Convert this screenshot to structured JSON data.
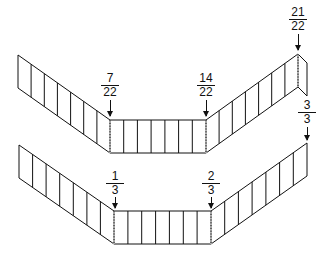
{
  "diagram": {
    "title": "",
    "strips": [
      {
        "id": "top-strip",
        "segments_total": 22,
        "labels": [
          {
            "num": "7",
            "den": "22",
            "x": 110,
            "y": 73,
            "arrow_top": 98,
            "arrow_bottom": 117
          },
          {
            "num": "14",
            "den": "22",
            "x": 206,
            "y": 73,
            "arrow_top": 98,
            "arrow_bottom": 117
          },
          {
            "num": "21",
            "den": "22",
            "x": 298,
            "y": 7,
            "arrow_top": 32,
            "arrow_bottom": 52
          }
        ]
      },
      {
        "id": "bottom-strip",
        "segments_total": 21,
        "labels": [
          {
            "num": "1",
            "den": "3",
            "x": 116,
            "y": 170,
            "arrow_top": 195,
            "arrow_bottom": 208
          },
          {
            "num": "2",
            "den": "3",
            "x": 211,
            "y": 170,
            "arrow_top": 195,
            "arrow_bottom": 208
          },
          {
            "num": "3",
            "den": "3",
            "x": 307,
            "y": 100,
            "arrow_top": 125,
            "arrow_bottom": 141
          }
        ]
      }
    ],
    "colors": {
      "stroke": "#111111",
      "background": "#ffffff"
    }
  }
}
